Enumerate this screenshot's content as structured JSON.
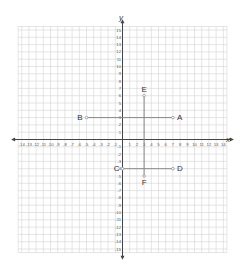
{
  "diagram": {
    "type": "coordinate-plane",
    "axes": {
      "x_label": "x",
      "y_label": "y",
      "x_range": [
        -14,
        14
      ],
      "y_range": [
        -15,
        15
      ]
    },
    "points": [
      {
        "label": "A",
        "x": 7,
        "y": 3
      },
      {
        "label": "B",
        "x": -5,
        "y": 3
      },
      {
        "label": "C",
        "x": 0,
        "y": -4
      },
      {
        "label": "D",
        "x": 7,
        "y": -4
      },
      {
        "label": "E",
        "x": 3,
        "y": 6
      },
      {
        "label": "F",
        "x": 3,
        "y": -5
      }
    ],
    "segments": [
      {
        "from": "A",
        "to": "B"
      },
      {
        "from": "C",
        "to": "D"
      },
      {
        "from": "E",
        "to": "F"
      }
    ],
    "colors": {
      "grid": "#d4d4d4",
      "axis": "#444444",
      "segment": "#888888",
      "text": "#333333"
    }
  }
}
